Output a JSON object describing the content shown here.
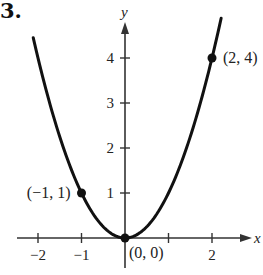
{
  "problem_number": "3.",
  "chart_data": {
    "type": "line",
    "title": "",
    "function": "y = x^2",
    "xlabel": "x",
    "ylabel": "y",
    "xlim": [
      -2.2,
      2.6
    ],
    "ylim": [
      -0.3,
      4.9
    ],
    "x_ticks": [
      -2,
      -1,
      1,
      2
    ],
    "x_tick_labels": [
      "−2",
      "−1",
      "",
      "2"
    ],
    "y_ticks": [
      1,
      2,
      3,
      4
    ],
    "y_tick_labels": [
      "1",
      "2",
      "3",
      "4"
    ],
    "grid": false,
    "legend": null,
    "curve_x_range": [
      -2.11,
      2.21
    ],
    "points": [
      {
        "x": -1,
        "y": 1,
        "label": "(−1, 1)"
      },
      {
        "x": 0,
        "y": 0,
        "label": "(0, 0)"
      },
      {
        "x": 2,
        "y": 4,
        "label": "(2, 4)"
      }
    ]
  },
  "colors": {
    "curve": "#111111",
    "axes": "#333333",
    "text": "#222222"
  }
}
